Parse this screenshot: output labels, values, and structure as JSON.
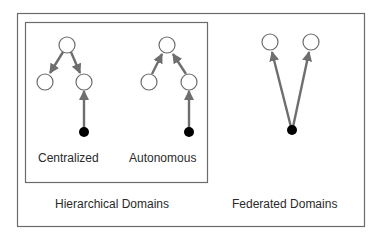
{
  "diagram": {
    "title": "",
    "colors": {
      "box_border": "#6b6b6b",
      "arrow": "#6e6e6e",
      "node_fill": "#ffffff",
      "node_stroke": "#6b6b6b",
      "source_node": "#000000",
      "text": "#2a2a2a"
    },
    "groups": [
      {
        "id": "hierarchical",
        "label": "Hierarchical Domains",
        "subgroups": [
          {
            "id": "centralized",
            "label": "Centralized",
            "nodes": [
              {
                "id": "c_root",
                "type": "open-circle"
              },
              {
                "id": "c_left",
                "type": "open-circle"
              },
              {
                "id": "c_right",
                "type": "open-circle"
              },
              {
                "id": "c_source",
                "type": "filled-dot"
              }
            ],
            "edges": [
              {
                "from": "c_root",
                "to": "c_left"
              },
              {
                "from": "c_root",
                "to": "c_right"
              },
              {
                "from": "c_source",
                "to": "c_right"
              }
            ]
          },
          {
            "id": "autonomous",
            "label": "Autonomous",
            "nodes": [
              {
                "id": "a_root",
                "type": "open-circle"
              },
              {
                "id": "a_left",
                "type": "open-circle"
              },
              {
                "id": "a_right",
                "type": "open-circle"
              },
              {
                "id": "a_source",
                "type": "filled-dot"
              }
            ],
            "edges": [
              {
                "from": "a_left",
                "to": "a_root"
              },
              {
                "from": "a_right",
                "to": "a_root"
              },
              {
                "from": "a_source",
                "to": "a_right"
              }
            ]
          }
        ]
      },
      {
        "id": "federated",
        "label": "Federated Domains",
        "nodes": [
          {
            "id": "f_left",
            "type": "open-circle"
          },
          {
            "id": "f_right",
            "type": "open-circle"
          },
          {
            "id": "f_source",
            "type": "filled-dot"
          }
        ],
        "edges": [
          {
            "from": "f_source",
            "to": "f_left"
          },
          {
            "from": "f_source",
            "to": "f_right"
          }
        ]
      }
    ]
  }
}
